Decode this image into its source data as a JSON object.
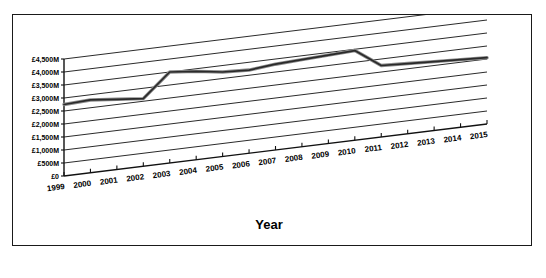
{
  "chart_data": {
    "type": "line",
    "title": "",
    "xlabel": "Year",
    "ylabel": "",
    "categories": [
      "1999",
      "2000",
      "2001",
      "2002",
      "2003",
      "2004",
      "2005",
      "2006",
      "2007",
      "2008",
      "2009",
      "2010",
      "2011",
      "2012",
      "2013",
      "2014",
      "2015"
    ],
    "series": [
      {
        "name": "Value",
        "values": [
          2750,
          2800,
          2700,
          2600,
          3500,
          3400,
          3250,
          3200,
          3300,
          3350,
          3400,
          3450,
          2750,
          2700,
          2650,
          2600,
          2550
        ]
      }
    ],
    "ytick_labels": [
      "£0",
      "£500M",
      "£1,000M",
      "£1,500M",
      "£2,000M",
      "£2,500M",
      "£3,000M",
      "£3,500M",
      "£4,000M",
      "£4,500M"
    ],
    "ytick_values": [
      0,
      500,
      1000,
      1500,
      2000,
      2500,
      3000,
      3500,
      4000,
      4500
    ],
    "ylim": [
      0,
      4500
    ],
    "grid": true,
    "legend": "none",
    "style": "3d-perspective",
    "line_color": "#2a2a2a",
    "grid_color": "#2b2b2b",
    "background": "#ffffff"
  }
}
